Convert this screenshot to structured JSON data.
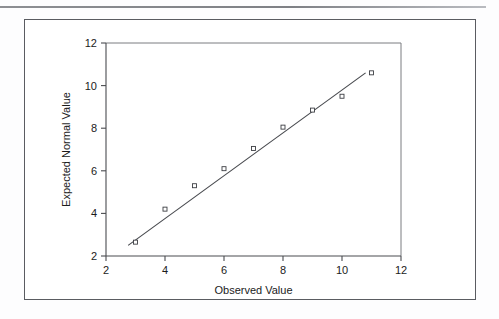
{
  "page": {
    "background_color": "#fdfdfe",
    "rule_color": "#8d8f93"
  },
  "figure": {
    "border_color": "#5a5c61",
    "background_color": "#ffffff"
  },
  "chart_data": {
    "type": "scatter",
    "title": "",
    "subtitle": "",
    "xlabel": "Observed Value",
    "ylabel": "Expected Normal Value",
    "xlim": [
      2,
      12
    ],
    "ylim": [
      2,
      12
    ],
    "xticks": [
      2,
      4,
      6,
      8,
      10,
      12
    ],
    "yticks": [
      2,
      4,
      6,
      8,
      10,
      12
    ],
    "xtick_labels": [
      "2",
      "4",
      "6",
      "8",
      "10",
      "12"
    ],
    "ytick_labels": [
      "2",
      "4",
      "6",
      "8",
      "10",
      "12"
    ],
    "grid": false,
    "legend": null,
    "marker": "open-square",
    "marker_color": "#3c3e43",
    "line_color": "#46484d",
    "series": [
      {
        "name": "Expected Normal Value",
        "x": [
          3,
          4,
          5,
          6,
          7,
          8,
          9,
          10,
          11
        ],
        "y": [
          2.65,
          4.2,
          5.3,
          6.1,
          7.05,
          8.05,
          8.85,
          9.5,
          10.6
        ]
      }
    ],
    "reference_line": {
      "name": "fit-line",
      "x": [
        2.75,
        10.8
      ],
      "y": [
        2.5,
        10.6
      ]
    }
  }
}
